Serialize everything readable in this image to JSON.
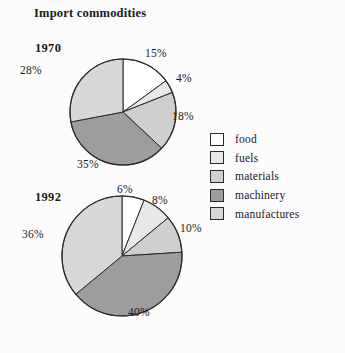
{
  "figure": {
    "title": "Import commodities",
    "background": "#fcfcfc"
  },
  "legend": {
    "position": "right",
    "items": [
      {
        "label": "food",
        "color": "#ffffff"
      },
      {
        "label": "fuels",
        "color": "#e8e8e8"
      },
      {
        "label": "materials",
        "color": "#cfcfcf"
      },
      {
        "label": "machinery",
        "color": "#9d9d9d"
      },
      {
        "label": "manufactures",
        "color": "#d8d8d8"
      }
    ]
  },
  "chart_data": [
    {
      "type": "pie",
      "title": "1970",
      "categories": [
        "food",
        "fuels",
        "materials",
        "machinery",
        "manufactures"
      ],
      "values": [
        15,
        4,
        18,
        35,
        28
      ],
      "labels": [
        "15%",
        "4%",
        "18%",
        "35%",
        "28%"
      ],
      "colors": [
        "#ffffff",
        "#e8e8e8",
        "#cfcfcf",
        "#9d9d9d",
        "#d8d8d8"
      ],
      "start_angle_deg": 0,
      "direction": "clockwise",
      "units": "percent"
    },
    {
      "type": "pie",
      "title": "1992",
      "categories": [
        "food",
        "fuels",
        "materials",
        "machinery",
        "manufactures"
      ],
      "values": [
        6,
        8,
        10,
        40,
        36
      ],
      "labels": [
        "6%",
        "8%",
        "10%",
        "40%",
        "36%"
      ],
      "colors": [
        "#ffffff",
        "#e8e8e8",
        "#cfcfcf",
        "#9d9d9d",
        "#d8d8d8"
      ],
      "start_angle_deg": 0,
      "direction": "clockwise",
      "units": "percent"
    }
  ],
  "pie_1970": {
    "label_food": "15%",
    "label_fuels": "4%",
    "label_materials": "18%",
    "label_machinery": "35%",
    "label_manufactures": "28%",
    "year": "1970"
  },
  "pie_1992": {
    "label_food": "6%",
    "label_fuels": "8%",
    "label_materials": "10%",
    "label_machinery": "40%",
    "label_manufactures": "36%",
    "year": "1992"
  }
}
